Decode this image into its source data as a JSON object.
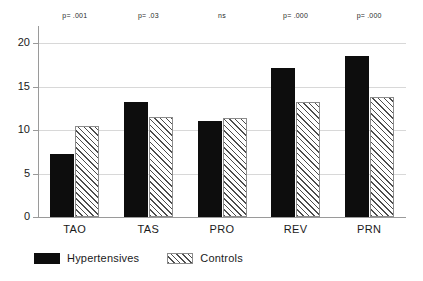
{
  "chart_data": {
    "type": "bar",
    "title": "",
    "subtitle": "",
    "xlabel": "",
    "ylabel": "",
    "categories": [
      "TAO",
      "TAS",
      "PRO",
      "REV",
      "PRN"
    ],
    "series": [
      {
        "name": "Hypertensives",
        "fill": "solid-black",
        "color": "#0d0d0d",
        "values": [
          7.3,
          13.3,
          11.1,
          17.2,
          18.6
        ]
      },
      {
        "name": "Controls",
        "fill": "diagonal-hatch",
        "color": "#ffffff",
        "values": [
          10.5,
          11.5,
          11.4,
          13.3,
          13.8
        ]
      }
    ],
    "ylim": [
      0,
      22
    ],
    "yticks": [
      0,
      5,
      10,
      15,
      20
    ],
    "ytick_labels": [
      "0",
      "5",
      "10",
      "15",
      "20"
    ],
    "grid": true,
    "grid_axis": "y",
    "legend_position": "bottom-left",
    "annotations": [
      {
        "category": "TAO",
        "text": "p= .001"
      },
      {
        "category": "TAS",
        "text": "p= .03"
      },
      {
        "category": "PRO",
        "text": "ns"
      },
      {
        "category": "REV",
        "text": "p= .000"
      },
      {
        "category": "PRN",
        "text": "p= .000"
      }
    ]
  },
  "legend": {
    "entries": [
      {
        "label": "Hypertensives"
      },
      {
        "label": "Controls"
      }
    ]
  }
}
